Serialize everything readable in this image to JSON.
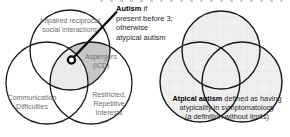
{
  "figure": {
    "description_left": "three-set venn diagram of autism diagnostic criteria",
    "description_right": "stippled venn diagram representing atypical autism"
  },
  "left_venn": {
    "top_label": "Impaired reciprocal\nsocial interactions",
    "left_label": "Communication\nDifficulties",
    "right_label": "Restricted,\nRepetitive\nInterests",
    "center_label": "Aspergers\n(ICD)"
  },
  "annotation": {
    "lead": "Autism",
    "rest": " if\npresent before 3;\notherwise\natypical autism"
  },
  "right_venn": {
    "caption_lead": "Atpical autism",
    "caption_rest": " defined as having\natypicality in symptomatology\n(a definition without limits)"
  },
  "palette": {
    "ink": "#1a1a1a",
    "label_gray": "#6e6e6e",
    "lens_fill": "#c7c7c7",
    "triple_fill": "#eaeaea",
    "stipple_base": "#f1f1f1",
    "stipple_dot": "#d7d7d7",
    "background": "#ffffff"
  }
}
